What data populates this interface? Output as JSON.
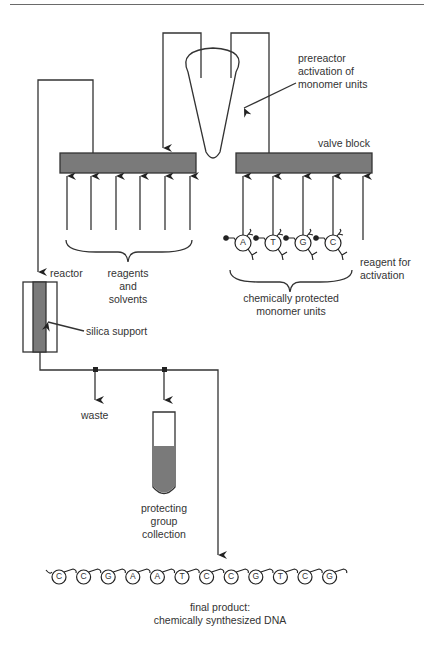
{
  "labels": {
    "prereactor": [
      "prereactor",
      "activation of",
      "monomer units"
    ],
    "valve_block": "valve block",
    "reagent_for_activation": [
      "reagent for",
      "activation"
    ],
    "reagents_and_solvents": [
      "reagents",
      "and",
      "solvents"
    ],
    "chemically_protected": [
      "chemically protected",
      "monomer units"
    ],
    "reactor": "reactor",
    "silica_support": "silica support",
    "waste": "waste",
    "protecting_group_collection": [
      "protecting",
      "group",
      "collection"
    ],
    "final_product": [
      "final product:",
      "chemically synthesized DNA"
    ]
  },
  "monomers": [
    "A",
    "T",
    "G",
    "C"
  ],
  "dna_sequence": [
    "C",
    "C",
    "G",
    "A",
    "A",
    "T",
    "C",
    "C",
    "G",
    "T",
    "C",
    "G"
  ],
  "colors": {
    "block_fill": "#7a7a7a",
    "line": "#333333",
    "text": "#333333",
    "liquid": "#7a7a7a"
  }
}
